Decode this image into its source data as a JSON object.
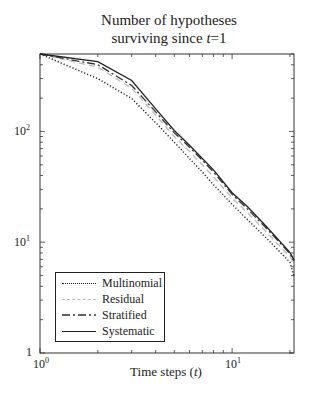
{
  "chart_data": {
    "type": "line",
    "title_lines": [
      "Number of hypotheses",
      "surviving since t=1"
    ],
    "xlabel": "Time steps (t)",
    "ylabel": "",
    "xscale": "log",
    "yscale": "log",
    "xlim": [
      1,
      21
    ],
    "ylim": [
      1,
      500
    ],
    "x_ticks": [
      "10^0",
      "10^1"
    ],
    "y_ticks": [
      "1",
      "10^1",
      "10^2"
    ],
    "grid": false,
    "legend_position": "lower left",
    "x": [
      1,
      2,
      3,
      4,
      5,
      6,
      7,
      8,
      10,
      12,
      15,
      20,
      21
    ],
    "series": [
      {
        "name": "Multinomial",
        "style": "dotted",
        "color": "#222222",
        "values": [
          500,
          300,
          198,
          120,
          80,
          57,
          43,
          33,
          22,
          16,
          11,
          6.6,
          4.9
        ]
      },
      {
        "name": "Residual",
        "style": "dashed",
        "color": "#bbbbbb",
        "values": [
          500,
          380,
          245,
          140,
          90,
          66,
          50,
          39,
          25,
          18.5,
          12.5,
          7.4,
          6.4
        ]
      },
      {
        "name": "Stratified",
        "style": "dashdot",
        "color": "#333333",
        "values": [
          500,
          400,
          260,
          150,
          97,
          72,
          55,
          43,
          27,
          20,
          13.5,
          7.9,
          6.8
        ]
      },
      {
        "name": "Systematic",
        "style": "solid",
        "color": "#222222",
        "values": [
          500,
          427,
          288,
          160,
          102,
          75,
          57,
          45,
          28,
          21,
          14,
          8.1,
          6.9
        ]
      }
    ]
  },
  "labels": {
    "title_line1": "Number of hypotheses",
    "title_line2_pre": "surviving since ",
    "title_line2_var": "t",
    "title_line2_post": "=1",
    "xlabel_pre": "Time steps (",
    "xlabel_var": "t",
    "xlabel_post": ")",
    "ytick_1": "1",
    "ytick_10_base": "10",
    "ytick_10_exp": "1",
    "ytick_100_base": "10",
    "ytick_100_exp": "2",
    "xtick_1_base": "10",
    "xtick_1_exp": "0",
    "xtick_10_base": "10",
    "xtick_10_exp": "1"
  },
  "legend": [
    {
      "label": "Multinomial"
    },
    {
      "label": "Residual"
    },
    {
      "label": "Stratified"
    },
    {
      "label": "Systematic"
    }
  ]
}
